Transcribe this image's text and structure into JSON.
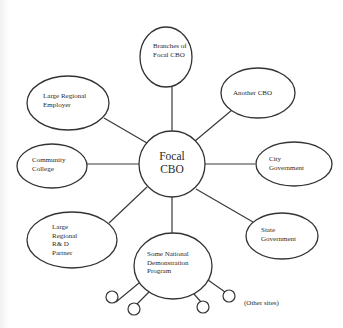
{
  "diagram": {
    "type": "hub-and-spoke",
    "hub": {
      "label": "Focal\nCBO"
    },
    "nodes": [
      {
        "id": "branches",
        "label": "Branches of\nFocal CBO"
      },
      {
        "id": "another-cbo",
        "label": "Another CBO"
      },
      {
        "id": "large-regional-employer",
        "label": "Large Regional\nEmployer"
      },
      {
        "id": "community-college",
        "label": "Community\nCollege"
      },
      {
        "id": "city-government",
        "label": "City\nGovernment"
      },
      {
        "id": "state-government",
        "label": "State\nGovernment"
      },
      {
        "id": "large-regional-rd-partner",
        "label": "Large\nRegional\nR& D\nPartner"
      },
      {
        "id": "national-demo-program",
        "label": "Some National\nDemonstration\nProgram"
      }
    ],
    "sub_sites": {
      "count": 4,
      "label": "(Other sites)"
    }
  }
}
